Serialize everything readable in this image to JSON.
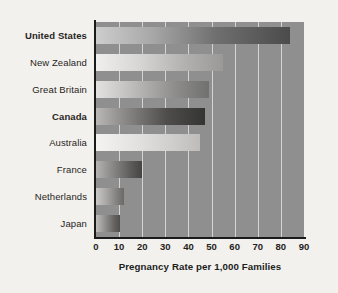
{
  "chart_data": {
    "type": "bar",
    "orientation": "horizontal",
    "title": "",
    "xlabel": "Pregnancy Rate per 1,000 Families",
    "ylabel": "",
    "categories": [
      "United States",
      "New Zealand",
      "Great Britain",
      "Canada",
      "Australia",
      "France",
      "Netherlands",
      "Japan"
    ],
    "values": [
      84,
      55,
      49,
      47,
      45,
      20,
      12,
      10.5
    ],
    "emphasized_categories": [
      "United States",
      "Canada"
    ],
    "xlim": [
      0,
      90
    ],
    "xticks": [
      0,
      10,
      20,
      30,
      40,
      50,
      60,
      70,
      80,
      90
    ],
    "xtick_labels": [
      "0",
      "10",
      "20",
      "30",
      "40",
      "50",
      "60",
      "70",
      "80",
      "90"
    ],
    "grid": "vertical",
    "legend": "none",
    "plot_background": "#8f8f8f",
    "figure_background": "#f3f1ed",
    "gridline_color": "#ffffff",
    "axis_color": "#1a1a1a"
  },
  "axis": {
    "title": "Pregnancy Rate per 1,000 Families"
  }
}
